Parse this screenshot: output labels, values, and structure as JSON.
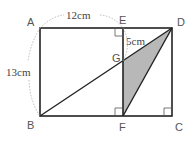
{
  "diagram": {
    "type": "geometry",
    "points": {
      "A": {
        "label": "A",
        "x": 40,
        "y": 28
      },
      "D": {
        "label": "D",
        "x": 172,
        "y": 28
      },
      "B": {
        "label": "B",
        "x": 40,
        "y": 116
      },
      "C": {
        "label": "C",
        "x": 172,
        "y": 116
      },
      "E": {
        "label": "E",
        "x": 123,
        "y": 28
      },
      "F": {
        "label": "F",
        "x": 123,
        "y": 116
      },
      "G": {
        "label": "G",
        "x": 123,
        "y": 61
      }
    },
    "dimensions": {
      "AE": "12cm",
      "AB": "13cm",
      "EG": "5cm"
    },
    "shaded_region": "triangle GFD",
    "shade_color": "#b8b8b8",
    "line_color": "#222222",
    "dashed_color": "#aaaaaa",
    "right_angles": [
      "E",
      "F",
      "C"
    ]
  }
}
